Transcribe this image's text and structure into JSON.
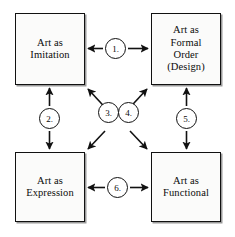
{
  "diagram": {
    "type": "relationship-matrix",
    "background_color": "#ffffff",
    "line_color": "#111111",
    "box_fill_color": "#fbfbfa",
    "nodes": [
      {
        "id": "imitation",
        "label": "Art as\nImitation",
        "position": "top-left"
      },
      {
        "id": "formal",
        "label": "Art as\nFormal\nOrder\n(Design)",
        "position": "top-right"
      },
      {
        "id": "expression",
        "label": "Art as\nExpression",
        "position": "bottom-left"
      },
      {
        "id": "functional",
        "label": "Art as\nFunctional",
        "position": "bottom-right"
      }
    ],
    "edges": [
      {
        "number": "1.",
        "from": "imitation",
        "to": "formal",
        "orientation": "horizontal",
        "arrowheads": "both"
      },
      {
        "number": "2.",
        "from": "imitation",
        "to": "expression",
        "orientation": "vertical",
        "arrowheads": "both"
      },
      {
        "number": "3.",
        "from": "expression",
        "to": "formal",
        "orientation": "diagonal",
        "arrowheads": "both"
      },
      {
        "number": "4.",
        "from": "imitation",
        "to": "functional",
        "orientation": "diagonal",
        "arrowheads": "both"
      },
      {
        "number": "5.",
        "from": "formal",
        "to": "functional",
        "orientation": "vertical",
        "arrowheads": "both"
      },
      {
        "number": "6.",
        "from": "expression",
        "to": "functional",
        "orientation": "horizontal",
        "arrowheads": "both"
      }
    ]
  }
}
